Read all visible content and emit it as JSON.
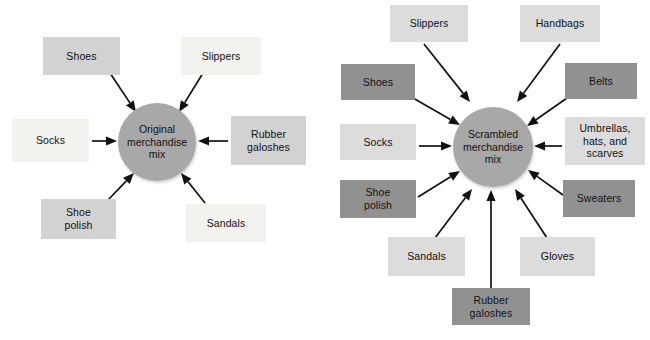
{
  "figure": {
    "background": "#ffffff",
    "colors": {
      "hub_fill": "#a8a8a8",
      "box_dark": "#919191",
      "box_light": "#dcdcdc",
      "box_mid": "#d2d2d2",
      "box_pale": "#f2f2ef",
      "arrow": "#111111",
      "text": "#111111"
    }
  },
  "diagrams": [
    {
      "id": "original-merchandise-mix",
      "hub": {
        "label": "Original\nmerchandise\nmix",
        "line1": "Original",
        "line2": "merchandise",
        "line3": "mix",
        "cx": 157,
        "cy": 142,
        "r": 39
      },
      "nodes": [
        {
          "id": "shoes",
          "label": "Shoes",
          "tone": "mid",
          "x": 43,
          "y": 37,
          "w": 77,
          "h": 38
        },
        {
          "id": "slippers",
          "label": "Slippers",
          "tone": "pale",
          "x": 181,
          "y": 37,
          "w": 80,
          "h": 38
        },
        {
          "id": "socks",
          "label": "Socks",
          "tone": "pale",
          "x": 12,
          "y": 119,
          "w": 77,
          "h": 43
        },
        {
          "id": "rubber-galoshes",
          "label": "Rubber\ngaloshes",
          "tone": "mid",
          "x": 231,
          "y": 116,
          "w": 75,
          "h": 49
        },
        {
          "id": "shoe-polish",
          "label": "Shoe\npolish",
          "tone": "mid",
          "x": 41,
          "y": 199,
          "w": 75,
          "h": 40
        },
        {
          "id": "sandals",
          "label": "Sandals",
          "tone": "pale",
          "x": 186,
          "y": 204,
          "w": 80,
          "h": 38
        }
      ],
      "arrows": [
        {
          "id": "shoes-to-hub",
          "x1": 110,
          "y1": 73,
          "x2": 136,
          "y2": 112
        },
        {
          "id": "slippers-to-hub",
          "x1": 203,
          "y1": 73,
          "x2": 179,
          "y2": 112
        },
        {
          "id": "socks-to-hub",
          "x1": 92,
          "y1": 141,
          "x2": 117,
          "y2": 141
        },
        {
          "id": "rubber-galoshes-to-hub",
          "x1": 228,
          "y1": 141,
          "x2": 198,
          "y2": 141
        },
        {
          "id": "shoe-polish-to-hub",
          "x1": 108,
          "y1": 200,
          "x2": 134,
          "y2": 173
        },
        {
          "id": "sandals-to-hub",
          "x1": 205,
          "y1": 203,
          "x2": 181,
          "y2": 173
        }
      ]
    },
    {
      "id": "scrambled-merchandise-mix",
      "hub": {
        "label": "Scrambled\nmerchandise\nmix",
        "line1": "Scrambled",
        "line2": "merchandise",
        "line3": "mix",
        "cx": 168,
        "cy": 147,
        "r": 40
      },
      "nodes": [
        {
          "id": "slippers",
          "label": "Slippers",
          "tone": "light",
          "x": 65,
          "y": 5,
          "w": 78,
          "h": 37
        },
        {
          "id": "handbags",
          "label": "Handbags",
          "tone": "light",
          "x": 195,
          "y": 5,
          "w": 80,
          "h": 37
        },
        {
          "id": "shoes",
          "label": "Shoes",
          "tone": "dark",
          "x": 16,
          "y": 64,
          "w": 74,
          "h": 36
        },
        {
          "id": "belts",
          "label": "Belts",
          "tone": "dark",
          "x": 240,
          "y": 63,
          "w": 72,
          "h": 36
        },
        {
          "id": "socks",
          "label": "Socks",
          "tone": "light",
          "x": 15,
          "y": 124,
          "w": 76,
          "h": 36
        },
        {
          "id": "umbrellas-hats-scarves",
          "label": "Umbrellas,\nhats, and\nscarves",
          "tone": "light",
          "x": 240,
          "y": 117,
          "w": 80,
          "h": 48
        },
        {
          "id": "shoe-polish",
          "label": "Shoe\npolish",
          "tone": "dark",
          "x": 15,
          "y": 180,
          "w": 76,
          "h": 38
        },
        {
          "id": "sweaters",
          "label": "Sweaters",
          "tone": "dark",
          "x": 238,
          "y": 180,
          "w": 72,
          "h": 37
        },
        {
          "id": "sandals",
          "label": "Sandals",
          "tone": "light",
          "x": 63,
          "y": 237,
          "w": 77,
          "h": 39
        },
        {
          "id": "gloves",
          "label": "Gloves",
          "tone": "light",
          "x": 195,
          "y": 237,
          "w": 75,
          "h": 39
        },
        {
          "id": "rubber-galoshes",
          "label": "Rubber\ngaloshes",
          "tone": "dark",
          "x": 127,
          "y": 288,
          "w": 78,
          "h": 37
        }
      ],
      "arrows": [
        {
          "id": "slippers-to-hub",
          "x1": 99,
          "y1": 44,
          "x2": 145,
          "y2": 102
        },
        {
          "id": "handbags-to-hub",
          "x1": 235,
          "y1": 44,
          "x2": 192,
          "y2": 102
        },
        {
          "id": "shoes-to-hub",
          "x1": 88,
          "y1": 98,
          "x2": 135,
          "y2": 125
        },
        {
          "id": "belts-to-hub",
          "x1": 242,
          "y1": 98,
          "x2": 202,
          "y2": 126
        },
        {
          "id": "socks-to-hub",
          "x1": 94,
          "y1": 146,
          "x2": 127,
          "y2": 146
        },
        {
          "id": "umbrellas-to-hub",
          "x1": 237,
          "y1": 146,
          "x2": 209,
          "y2": 146
        },
        {
          "id": "shoe-polish-to-hub",
          "x1": 93,
          "y1": 197,
          "x2": 135,
          "y2": 171
        },
        {
          "id": "sweaters-to-hub",
          "x1": 238,
          "y1": 195,
          "x2": 203,
          "y2": 170
        },
        {
          "id": "sandals-to-hub",
          "x1": 110,
          "y1": 238,
          "x2": 147,
          "y2": 189
        },
        {
          "id": "gloves-to-hub",
          "x1": 222,
          "y1": 238,
          "x2": 190,
          "y2": 189
        },
        {
          "id": "rubber-galoshes-to-hub",
          "x1": 166,
          "y1": 289,
          "x2": 166,
          "y2": 190
        }
      ]
    }
  ]
}
